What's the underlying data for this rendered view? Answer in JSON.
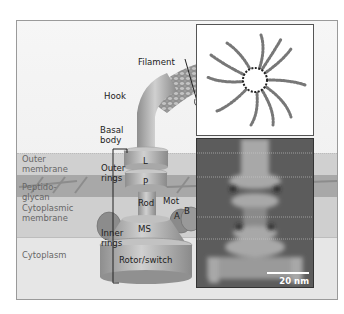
{
  "diagram": {
    "layers": [
      {
        "label": "Outer\nmembrane"
      },
      {
        "label": "Peptido-\nglycan"
      },
      {
        "label": "Cytoplasmic\nmembrane"
      },
      {
        "label": "Cytoplasm"
      }
    ],
    "structure_labels": {
      "filament": "Filament",
      "hook": "Hook",
      "basal_body": "Basal\nbody",
      "outer_rings": "Outer\nrings",
      "inner_rings": "Inner\nrings",
      "L": "L",
      "P": "P",
      "rod": "Rod",
      "mot": "Mot",
      "A": "A",
      "B": "B",
      "MS": "MS",
      "rotor": "Rotor/switch"
    },
    "em_image": {
      "scale_bar_label": "20 nm"
    },
    "colors": {
      "frame_border": "#9a9a9a",
      "membrane_band": "#c8c8c8",
      "peptidoglycan_band": "#a9a9a9",
      "motor_body": "#b5b5b5",
      "label_gray": "#666666",
      "em_bg": "#5c5c5c"
    }
  }
}
